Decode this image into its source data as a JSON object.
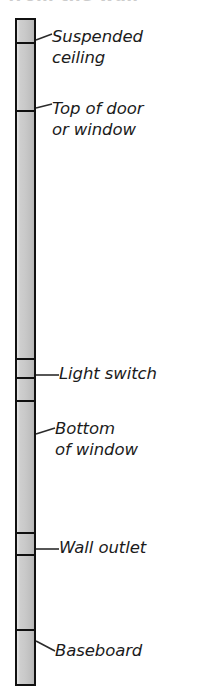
{
  "title": {
    "text": "from the wall"
  },
  "diagram": {
    "type": "wall-section-elevation",
    "orientation": "vertical",
    "colors": {
      "column_fill": "#c9c9c9",
      "column_stroke": "#111111",
      "leader_line": "#2b2b2b",
      "label_text": "#1b1b1b",
      "background": "#ffffff"
    },
    "column": {
      "name": "wall-column",
      "x": 15,
      "y": 18,
      "width": 21,
      "height": 668,
      "divider_offsets": [
        22,
        90,
        356,
        375,
        398,
        530,
        552,
        627
      ]
    },
    "callouts": [
      {
        "id": "suspended-ceiling",
        "label": "Suspended\nceiling",
        "label_x": 52,
        "label_y": 26,
        "leader": {
          "x1": 36,
          "y1": 40,
          "x2": 52,
          "y2": 34
        }
      },
      {
        "id": "top-of-door-or-window",
        "label": "Top of door\nor window",
        "label_x": 52,
        "label_y": 98,
        "leader": {
          "x1": 36,
          "y1": 108,
          "x2": 52,
          "y2": 104
        }
      },
      {
        "id": "light-switch",
        "label": "Light switch",
        "label_x": 59,
        "label_y": 363,
        "leader": {
          "x1": 36,
          "y1": 375,
          "x2": 59,
          "y2": 375
        }
      },
      {
        "id": "bottom-of-window",
        "label": "Bottom\nof window",
        "label_x": 55,
        "label_y": 418,
        "leader": {
          "x1": 36,
          "y1": 434,
          "x2": 55,
          "y2": 428
        }
      },
      {
        "id": "wall-outlet",
        "label": "Wall outlet",
        "label_x": 59,
        "label_y": 537,
        "leader": {
          "x1": 36,
          "y1": 549,
          "x2": 59,
          "y2": 549
        }
      },
      {
        "id": "baseboard",
        "label": "Baseboard",
        "label_x": 55,
        "label_y": 640,
        "leader": {
          "x1": 36,
          "y1": 641,
          "x2": 55,
          "y2": 651
        }
      }
    ]
  }
}
